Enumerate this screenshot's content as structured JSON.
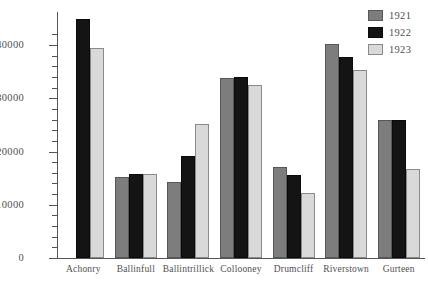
{
  "chart_data": {
    "type": "bar",
    "title": "",
    "subtitle": "",
    "xlabel": "",
    "ylabel": "",
    "categories": [
      "Achonry",
      "Ballinfull",
      "Ballintrillick",
      "Collooney",
      "Drumcliff",
      "Riverstown",
      "Gurteen"
    ],
    "series": [
      {
        "name": "1921",
        "color": "#7d7d7d",
        "values": [
          null,
          15200,
          14200,
          33800,
          17000,
          40200,
          26000
        ]
      },
      {
        "name": "1922",
        "color": "#141414",
        "values": [
          44800,
          15800,
          19200,
          34000,
          15600,
          37800,
          26000
        ]
      },
      {
        "name": "1923",
        "color": "#d9d9d9",
        "values": [
          39400,
          15800,
          25200,
          32500,
          12200,
          35400,
          16700
        ]
      }
    ],
    "ylim": [
      0,
      44800
    ],
    "ytick_major": [
      0,
      10000,
      20000,
      30000,
      40000
    ],
    "ytick_major_labels": [
      "0",
      "10000",
      "20000",
      "30000",
      "40000"
    ],
    "ytick_minor_step": 2000,
    "grid": false,
    "legend_position": "top-right",
    "legend_entries": [
      "1921",
      "1922",
      "1923"
    ]
  }
}
